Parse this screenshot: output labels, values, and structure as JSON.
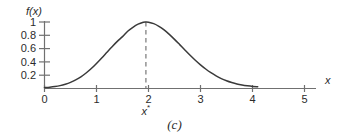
{
  "figure": {
    "caption": "(c)",
    "colors": {
      "axis": "#707070",
      "curve": "#3a3a3a",
      "dashed": "#8a8a8a",
      "text": "#2b2b2b",
      "background": "#ffffff"
    }
  },
  "chart_data": {
    "type": "line",
    "title": "",
    "xlabel": "x",
    "ylabel": "f(x)",
    "xlim": [
      0,
      5
    ],
    "ylim": [
      0,
      1.05
    ],
    "grid": false,
    "legend_position": "none",
    "x_ticks": [
      {
        "value": 0,
        "label": "0"
      },
      {
        "value": 1,
        "label": "1"
      },
      {
        "value": 2,
        "label": "2"
      },
      {
        "value": 3,
        "label": "3"
      },
      {
        "value": 4,
        "label": "4"
      },
      {
        "value": 5,
        "label": "5"
      }
    ],
    "y_ticks": [
      {
        "value": 0.2,
        "label": "0.2"
      },
      {
        "value": 0.4,
        "label": "0.4"
      },
      {
        "value": 0.6,
        "label": "0.6"
      },
      {
        "value": 0.8,
        "label": "0.8"
      },
      {
        "value": 1.0,
        "label": "1"
      }
    ],
    "series": [
      {
        "name": "f(x)",
        "x": [
          0.0,
          0.1,
          0.2,
          0.3,
          0.4,
          0.5,
          0.6,
          0.7,
          0.8,
          0.9,
          1.0,
          1.1,
          1.2,
          1.3,
          1.4,
          1.5,
          1.6,
          1.7,
          1.8,
          1.9,
          1.95,
          2.0,
          2.1,
          2.2,
          2.3,
          2.4,
          2.5,
          2.6,
          2.7,
          2.8,
          2.9,
          3.0,
          3.1,
          3.2,
          3.3,
          3.4,
          3.5,
          3.6,
          3.7,
          3.8,
          3.9,
          4.0,
          4.1
        ],
        "y": [
          0.007,
          0.013,
          0.022,
          0.036,
          0.057,
          0.085,
          0.122,
          0.169,
          0.227,
          0.295,
          0.372,
          0.455,
          0.541,
          0.626,
          0.706,
          0.778,
          0.86,
          0.92,
          0.967,
          0.996,
          1.0,
          0.997,
          0.975,
          0.935,
          0.88,
          0.813,
          0.737,
          0.657,
          0.576,
          0.496,
          0.421,
          0.351,
          0.288,
          0.232,
          0.184,
          0.143,
          0.11,
          0.083,
          0.061,
          0.045,
          0.033,
          0.024,
          0.02
        ]
      }
    ],
    "annotations": [
      {
        "name": "peak-marker",
        "type": "vertical-dashed-line",
        "x": 1.95,
        "y_from": 0,
        "y_to": 1.0,
        "label": "x*"
      }
    ]
  }
}
